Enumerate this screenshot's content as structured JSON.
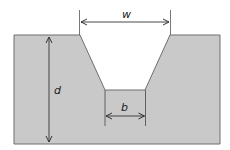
{
  "diagram": {
    "labels": {
      "top_width": "w",
      "depth": "d",
      "bottom_width": "b"
    },
    "colors": {
      "ground_fill": "#c9c9c9",
      "outline": "#6e6e6e",
      "arrow": "#333333",
      "background": "#ffffff"
    }
  }
}
